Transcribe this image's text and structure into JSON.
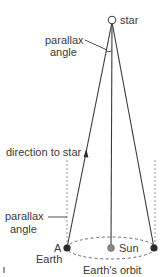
{
  "diagram": {
    "type": "stellar-parallax",
    "labels": {
      "star": "star",
      "parallax_top_line1": "parallax",
      "parallax_top_line2": "angle",
      "direction_to_star": "direction to star",
      "parallax_bottom_line1": "parallax",
      "parallax_bottom_line2": "angle",
      "earth_a_letter": "A",
      "earth_a_name": "Earth",
      "sun": "Sun",
      "orbit": "Earth's orbit"
    },
    "colors": {
      "line": "#3a3a3a",
      "earth": "#2a2a2a",
      "sun": "#8a8a8a",
      "star_fill": "#ffffff",
      "dashed": "#7a7a7a"
    },
    "points": {
      "star": {
        "x": 112,
        "y": 20
      },
      "earth_left": {
        "x": 67,
        "y": 248
      },
      "sun": {
        "x": 111,
        "y": 248
      },
      "earth_right": {
        "x": 154,
        "y": 248
      }
    }
  }
}
